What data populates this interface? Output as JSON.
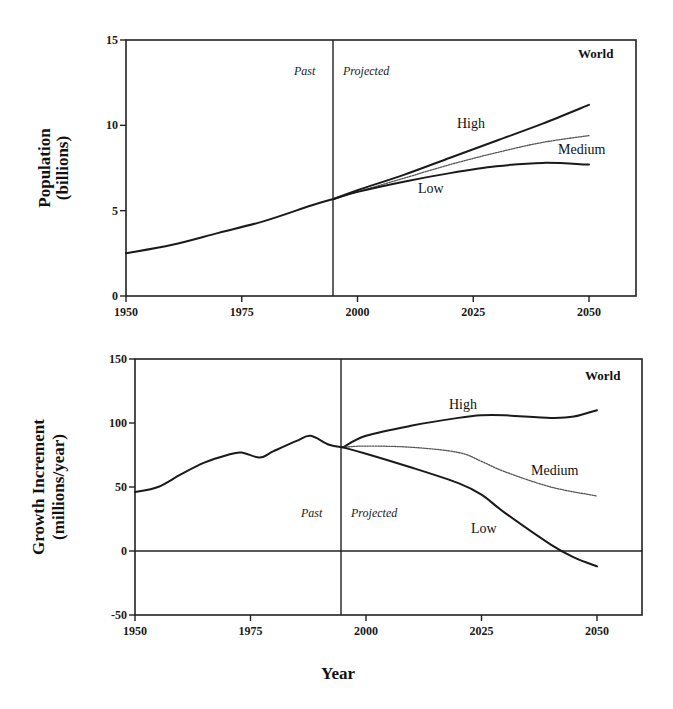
{
  "figure": {
    "xlabel": "Year",
    "region_past": "Past",
    "region_projected": "Projected",
    "region_label": "World"
  },
  "top": {
    "ylabel_line1": "Population",
    "ylabel_line2": "(billions)",
    "yticks": [
      "0",
      "5",
      "10",
      "15"
    ],
    "xticks": [
      "1950",
      "1975",
      "2000",
      "2025",
      "2050"
    ],
    "labels": {
      "high": "High",
      "medium": "Medium",
      "low": "Low"
    }
  },
  "bottom": {
    "ylabel_line1": "Growth Increment",
    "ylabel_line2": "(millions/year)",
    "yticks": [
      "-50",
      "0",
      "50",
      "100",
      "150"
    ],
    "xticks": [
      "1950",
      "1975",
      "2000",
      "2025",
      "2050"
    ],
    "labels": {
      "high": "High",
      "medium": "Medium",
      "low": "Low"
    }
  },
  "chart_data": [
    {
      "type": "line",
      "title": "World",
      "xlabel": "Year",
      "ylabel": "Population (billions)",
      "xlim": [
        1950,
        2060
      ],
      "ylim": [
        0,
        15
      ],
      "xticks": [
        1950,
        1975,
        2000,
        2025,
        2050
      ],
      "yticks": [
        0,
        5,
        10,
        15
      ],
      "grid": false,
      "annotations": [
        {
          "text": "Past",
          "x": 1990,
          "y": 13.5
        },
        {
          "text": "Projected",
          "x": 2003,
          "y": 13.5
        },
        {
          "text": "World",
          "x": 2052,
          "y": 14.2
        },
        {
          "type": "vline",
          "x": 1995
        }
      ],
      "series": [
        {
          "name": "Past",
          "style": "solid",
          "x": [
            1950,
            1960,
            1970,
            1980,
            1990,
            1995
          ],
          "y": [
            2.5,
            3.0,
            3.7,
            4.4,
            5.3,
            5.7
          ]
        },
        {
          "name": "High",
          "style": "solid",
          "x": [
            1995,
            2000,
            2010,
            2020,
            2030,
            2040,
            2050
          ],
          "y": [
            5.7,
            6.2,
            7.1,
            8.1,
            9.1,
            10.1,
            11.2
          ]
        },
        {
          "name": "Medium",
          "style": "dotted",
          "x": [
            1995,
            2000,
            2010,
            2020,
            2030,
            2040,
            2050
          ],
          "y": [
            5.7,
            6.1,
            6.9,
            7.7,
            8.4,
            9.0,
            9.4
          ]
        },
        {
          "name": "Low",
          "style": "solid",
          "x": [
            1995,
            2000,
            2010,
            2020,
            2030,
            2040,
            2050
          ],
          "y": [
            5.7,
            6.1,
            6.7,
            7.2,
            7.6,
            7.8,
            7.7
          ]
        }
      ]
    },
    {
      "type": "line",
      "title": "World",
      "xlabel": "Year",
      "ylabel": "Growth Increment (millions/year)",
      "xlim": [
        1950,
        2060
      ],
      "ylim": [
        -50,
        150
      ],
      "xticks": [
        1950,
        1975,
        2000,
        2025,
        2050
      ],
      "yticks": [
        -50,
        0,
        50,
        100,
        150
      ],
      "grid": false,
      "annotations": [
        {
          "text": "Past",
          "x": 1990,
          "y": 30
        },
        {
          "text": "Projected",
          "x": 2003,
          "y": 30
        },
        {
          "text": "World",
          "x": 2052,
          "y": 136
        },
        {
          "type": "vline",
          "x": 1995
        },
        {
          "type": "hline",
          "y": 0
        }
      ],
      "series": [
        {
          "name": "Past",
          "style": "solid",
          "x": [
            1950,
            1955,
            1960,
            1965,
            1970,
            1973,
            1977,
            1980,
            1985,
            1988,
            1992,
            1995
          ],
          "y": [
            46,
            50,
            60,
            69,
            75,
            77,
            73,
            78,
            86,
            90,
            83,
            81
          ]
        },
        {
          "name": "High",
          "style": "solid",
          "x": [
            1995,
            2000,
            2010,
            2020,
            2025,
            2030,
            2040,
            2045,
            2050
          ],
          "y": [
            81,
            90,
            98,
            104,
            106,
            106,
            104,
            105,
            110
          ]
        },
        {
          "name": "Medium",
          "style": "dotted",
          "x": [
            1995,
            2000,
            2010,
            2020,
            2025,
            2030,
            2040,
            2050
          ],
          "y": [
            81,
            82,
            81,
            77,
            70,
            62,
            50,
            43
          ]
        },
        {
          "name": "Low",
          "style": "solid",
          "x": [
            1995,
            2000,
            2010,
            2020,
            2025,
            2030,
            2040,
            2045,
            2050
          ],
          "y": [
            81,
            76,
            65,
            53,
            44,
            30,
            5,
            -5,
            -12
          ]
        }
      ]
    }
  ]
}
